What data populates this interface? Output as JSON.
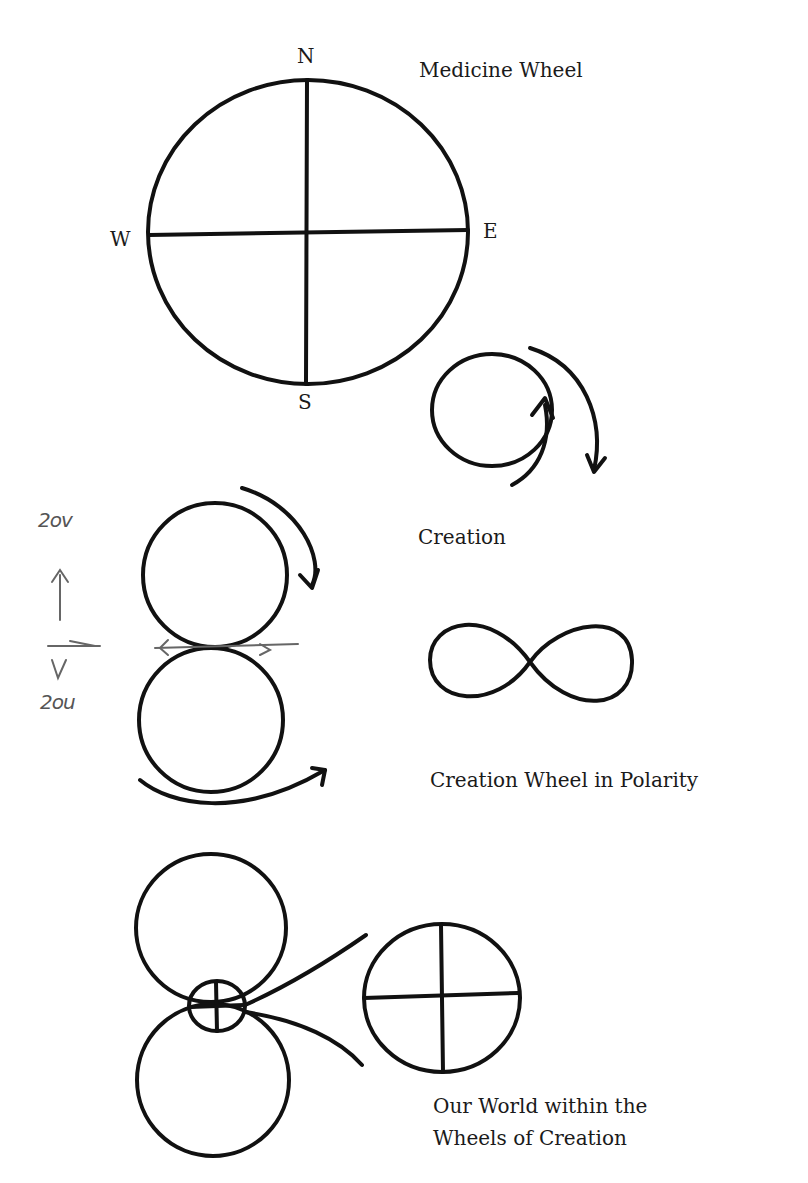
{
  "medicine_wheel": {
    "title": "Medicine Wheel",
    "directions": {
      "north": "N",
      "south": "S",
      "east": "E",
      "west": "W"
    }
  },
  "creation": {
    "caption": "Creation"
  },
  "polarity": {
    "caption": "Creation Wheel in Polarity",
    "annotation_top": "2ov",
    "annotation_bottom": "2ou"
  },
  "our_world": {
    "caption_line1": "Our World within the",
    "caption_line2": "Wheels of Creation"
  }
}
